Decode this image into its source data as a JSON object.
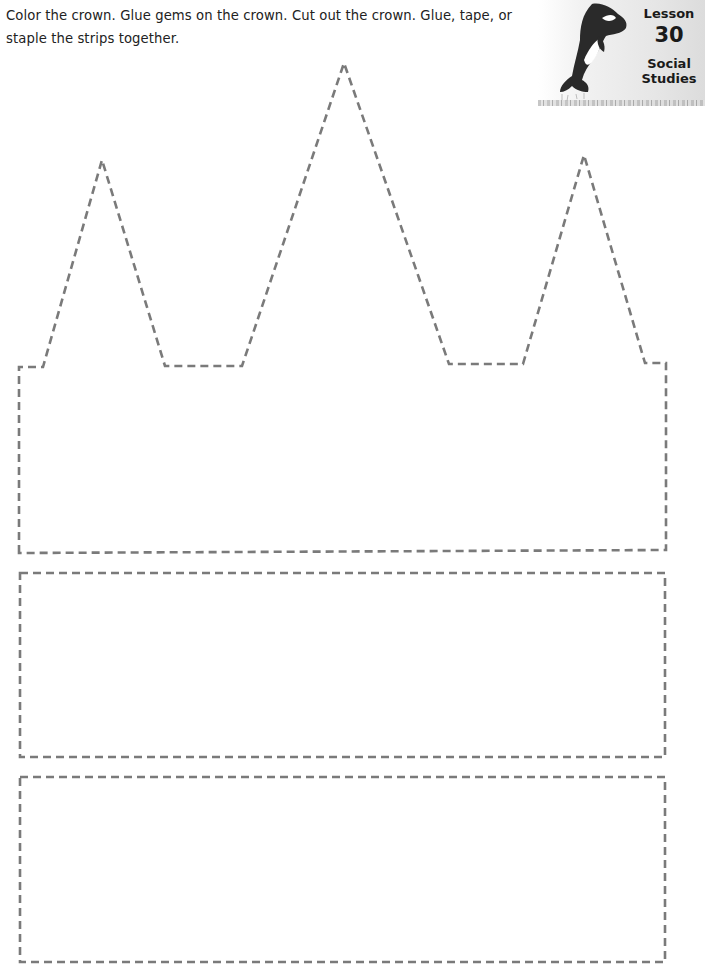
{
  "worksheet": {
    "instructions": "Color the crown. Glue gems on the crown. Cut out the crown. Glue, tape, or staple the strips together.",
    "badge": {
      "lesson_label": "Lesson",
      "lesson_number": "30",
      "subject_line1": "Social",
      "subject_line2": "Studies",
      "mascot": "orca-icon"
    },
    "cutouts": [
      {
        "name": "crown",
        "shape": "crown with three peaks"
      },
      {
        "name": "strip-1",
        "shape": "rectangle"
      },
      {
        "name": "strip-2",
        "shape": "rectangle"
      }
    ],
    "colors": {
      "dash_line": "#7a7a7a",
      "badge_bg": "#e6e6e6",
      "orca": "#2a2a2a"
    }
  }
}
